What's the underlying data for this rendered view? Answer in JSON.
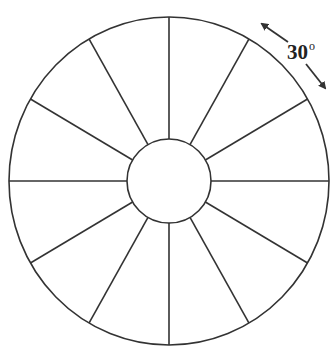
{
  "diagram": {
    "type": "segmented-wheel",
    "center": [
      169,
      181
    ],
    "outer_radius": [
      160,
      164
    ],
    "inner_radius": 42,
    "spoke_count": 12,
    "spoke_angle_step_deg": 30,
    "stroke_color": "#333333",
    "background": "#ffffff",
    "annotation": {
      "value": "30",
      "unit_symbol": "o",
      "meaning": "angle between adjacent spokes",
      "arrows": [
        {
          "from": [
            288,
            42
          ],
          "to": [
            262,
            24
          ],
          "direction": "counter-clockwise"
        },
        {
          "from": [
            306,
            64
          ],
          "to": [
            325,
            88
          ],
          "direction": "clockwise"
        }
      ]
    }
  }
}
